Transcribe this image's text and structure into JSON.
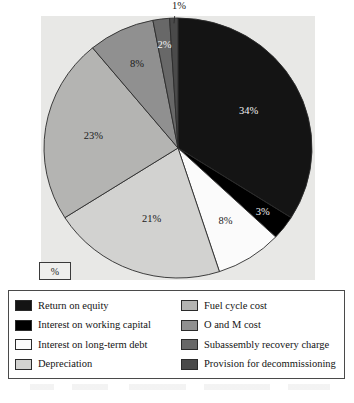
{
  "figure": {
    "axis_caption": "%"
  },
  "chart_data": {
    "type": "pie",
    "title": "",
    "xlabel": "",
    "ylabel": "",
    "unit": "%",
    "legend_position": "bottom",
    "grid": false,
    "start_angle_deg": 0,
    "direction": "clockwise",
    "categories": [
      "Return on equity",
      "Interest on working capital",
      "Interest on long-term debt",
      "Depreciation",
      "Fuel cycle cost",
      "O and M cost",
      "Subassembly recovery charge",
      "Provision for decommissioning"
    ],
    "values": [
      34,
      3,
      8,
      21,
      23,
      8,
      2,
      1
    ],
    "data_labels": [
      "34%",
      "3%",
      "8%",
      "21%",
      "23%",
      "8%",
      "2%",
      "1%"
    ],
    "colors": [
      "#141414",
      "#000000",
      "#fbfbfb",
      "#d2d2d0",
      "#b4b4b2",
      "#909090",
      "#686868",
      "#4a4a4a"
    ],
    "label_text_colors": [
      "light",
      "light",
      "dark",
      "dark",
      "dark",
      "dark",
      "light",
      "dark"
    ]
  },
  "legend": {
    "left_column": [
      {
        "label": "Return on equity",
        "color": "#141414"
      },
      {
        "label": "Interest on working capital",
        "color": "#000000"
      },
      {
        "label": "Interest on long-term debt",
        "color": "#fbfbfb"
      },
      {
        "label": "Depreciation",
        "color": "#d2d2d0"
      }
    ],
    "right_column": [
      {
        "label": "Fuel cycle cost",
        "color": "#b4b4b2"
      },
      {
        "label": "O and M cost",
        "color": "#909090"
      },
      {
        "label": "Subassembly recovery charge",
        "color": "#686868"
      },
      {
        "label": "Provision for decommissioning",
        "color": "#4a4a4a"
      }
    ]
  }
}
